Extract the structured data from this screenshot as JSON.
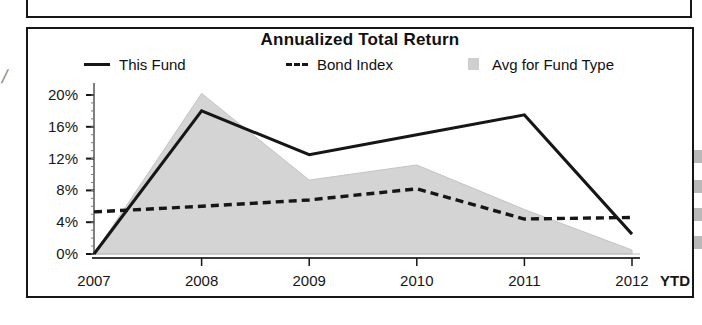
{
  "chart_data": {
    "type": "line",
    "title": "Annualized Total Return",
    "xlabel": "",
    "ylabel": "",
    "categories": [
      "2007",
      "2008",
      "2009",
      "2010",
      "2011",
      "2012 YTD"
    ],
    "x_tick_labels": [
      "2007",
      "2008",
      "2009",
      "2010",
      "2011",
      "2012"
    ],
    "x_last_suffix": "YTD",
    "y_tick_labels": [
      "20%",
      "16%",
      "12%",
      "8%",
      "4%",
      "0%"
    ],
    "y_ticks": [
      20,
      16,
      12,
      8,
      4,
      0
    ],
    "ylim": [
      0,
      21
    ],
    "grid": false,
    "legend_position": "top",
    "series": [
      {
        "name": "This Fund",
        "style": "solid-line",
        "color": "#161616",
        "values": [
          0.0,
          18.0,
          12.5,
          15.0,
          17.5,
          2.5
        ]
      },
      {
        "name": "Bond Index",
        "style": "dashed-line",
        "color": "#161616",
        "values": [
          5.3,
          6.0,
          6.8,
          8.2,
          4.4,
          4.6
        ]
      },
      {
        "name": "Avg for Fund Type",
        "style": "filled-area",
        "color": "#d4d4d4",
        "values": [
          0.0,
          20.2,
          9.3,
          11.2,
          5.6,
          0.5
        ]
      }
    ]
  },
  "chart": {
    "title": "Annualized Total Return",
    "legend": [
      {
        "label": "This Fund",
        "marker": "solid-line-swatch"
      },
      {
        "label": "Bond Index",
        "marker": "dashed-line-swatch"
      },
      {
        "label": "Avg for Fund Type",
        "marker": "shaded-square-swatch"
      }
    ]
  }
}
